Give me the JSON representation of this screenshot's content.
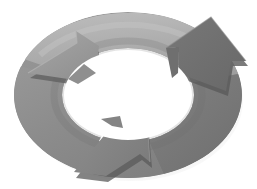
{
  "figure": {
    "title": "Three-stage circular cycle arrow diagram",
    "type": "cycle-diagram",
    "background_color": "#ffffff",
    "canvas": {
      "width": 257,
      "height": 189
    },
    "flow_direction": "counter-clockwise",
    "segment_count": 3,
    "style": "grayscale 3D elliptical ring with arrowheads",
    "ellipse": {
      "center_x": 128,
      "center_y": 95,
      "outer_radius_x": 114,
      "outer_radius_y": 83,
      "inner_radius_x": 66,
      "inner_radius_y": 47
    }
  },
  "palette": {
    "segment_light": "#a9a9a9",
    "segment_light_edge": "#bdbdbd",
    "segment_mid": "#8d8d8d",
    "segment_mid_edge": "#9c9c9c",
    "segment_dark": "#7a7a7a",
    "segment_dark_edge": "#6b6b6b",
    "arrowhead_light": "#9a9a9a",
    "arrowhead_mid": "#858585",
    "arrowhead_dark": "#6f6f6f",
    "thickness_edge": "#5e5e5e",
    "shadow": "#cfcfcf",
    "hole": "#ffffff"
  },
  "segments": [
    {
      "id": "segment-top",
      "label": "",
      "fill": "#a9a9a9",
      "position": "top",
      "arrowhead": {
        "id": "arrowhead-top-left",
        "direction": "left-down",
        "fill": "#9a9a9a",
        "tip_x": 30,
        "tip_y": 74
      }
    },
    {
      "id": "segment-right",
      "label": "",
      "fill": "#7a7a7a",
      "position": "right",
      "arrowhead": {
        "id": "arrowhead-right-up",
        "direction": "up-right",
        "fill": "#6f6f6f",
        "tip_x": 233,
        "tip_y": 39
      }
    },
    {
      "id": "segment-left-bottom",
      "label": "",
      "fill": "#8d8d8d",
      "position": "left-bottom",
      "arrowhead": {
        "id": "arrowhead-bottom",
        "direction": "down-left",
        "fill": "#858585",
        "tip_x": 78,
        "tip_y": 176
      }
    }
  ]
}
